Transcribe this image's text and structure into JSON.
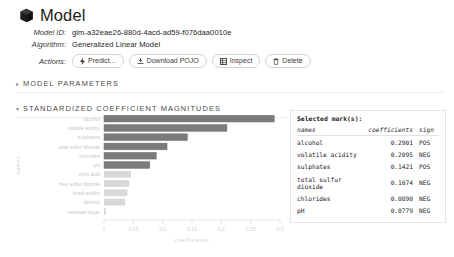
{
  "header": {
    "icon": "cube-icon",
    "title": "Model"
  },
  "meta": {
    "model_id_label": "Model ID:",
    "model_id_value": "glm-a32eae26-880d-4acd-ad59-f076daa0010e",
    "algorithm_label": "Algorithm:",
    "algorithm_value": "Generalized Linear Model",
    "actions_label": "Actions:"
  },
  "actions": [
    {
      "label": "Predict...",
      "icon": "lightning-icon"
    },
    {
      "label": "Download POJO",
      "icon": "download-icon"
    },
    {
      "label": "Inspect",
      "icon": "grid-icon"
    },
    {
      "label": "Delete",
      "icon": "trash-icon"
    }
  ],
  "sections": [
    {
      "arrow": "▸",
      "title": "MODEL PARAMETERS"
    },
    {
      "arrow": "▾",
      "title": "STANDARDIZED COEFFICIENT MAGNITUDES"
    }
  ],
  "marks": {
    "title": "Selected mark(s):",
    "columns": {
      "names": "names",
      "coefficients": "coefficients",
      "sign": "sign"
    },
    "rows": [
      {
        "name": "alcohol",
        "coefficient": "0.2901",
        "sign": "POS"
      },
      {
        "name": "volatile acidity",
        "coefficient": "0.2095",
        "sign": "NEG"
      },
      {
        "name": "sulphates",
        "coefficient": "0.1421",
        "sign": "POS"
      },
      {
        "name": "total sulfur dioxide",
        "coefficient": "0.1074",
        "sign": "NEG"
      },
      {
        "name": "chlorides",
        "coefficient": "0.0890",
        "sign": "NEG"
      },
      {
        "name": "pH",
        "coefficient": "0.0779",
        "sign": "NEG"
      }
    ]
  },
  "chart_data": {
    "type": "bar",
    "orientation": "horizontal",
    "title": "",
    "xlabel": "coefficients",
    "ylabel": "names",
    "xlim": [
      0,
      0.3
    ],
    "xticks": [
      0,
      0.05,
      0.1,
      0.15,
      0.2,
      0.25,
      0.3
    ],
    "xticklabels": [
      "0",
      "0.05",
      "0.1",
      "0.15",
      "0.2",
      "0.25",
      "0.3"
    ],
    "grid": false,
    "categories": [
      "alcohol",
      "volatile acidity",
      "sulphates",
      "total sulfur dioxide",
      "chlorides",
      "pH",
      "citric acid",
      "free sulfur dioxide",
      "fixed acidity",
      "density",
      "residual sugar"
    ],
    "values": [
      0.2901,
      0.2095,
      0.1421,
      0.1074,
      0.089,
      0.0779,
      0.046,
      0.043,
      0.04,
      0.036,
      0.003
    ],
    "selected": [
      true,
      true,
      true,
      true,
      true,
      true,
      false,
      false,
      false,
      false,
      false
    ],
    "colors": {
      "selected": "#7b7b7b",
      "unselected": "#d8d8d8",
      "stroke": "#6f6f6f"
    }
  }
}
